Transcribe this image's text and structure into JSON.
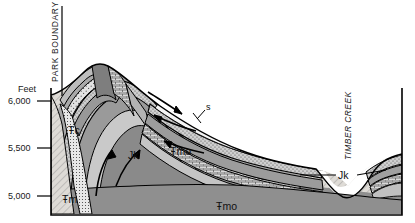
{
  "figure": {
    "type": "geologic-cross-section",
    "background_color": "#ffffff",
    "line_color": "#000000"
  },
  "axis": {
    "unit_label": "Feet",
    "ticks": [
      {
        "label": "6,000",
        "y": 101
      },
      {
        "label": "5,500",
        "y": 148
      },
      {
        "label": "5,000",
        "y": 196
      }
    ]
  },
  "annotations": {
    "park_boundary": "PARK BOUNDARY",
    "timber_creek": "TIMBER CREEK"
  },
  "units": [
    {
      "id": "TRc",
      "label": "Ŧc",
      "x": 77,
      "y": 131,
      "fill": "#a8a8a8"
    },
    {
      "id": "Jk",
      "label": "Jk",
      "x": 134,
      "y": 155,
      "fill": "#d4d4d4"
    },
    {
      "id": "TRmo",
      "label": "Ŧmo",
      "x": 181,
      "y": 152,
      "fill": "#8f8f8f"
    },
    {
      "id": "TRm",
      "label": "Ŧm",
      "x": 70,
      "y": 199,
      "fill": "#d8d6d2"
    },
    {
      "id": "TRmo2",
      "label": "Ŧmo",
      "x": 228,
      "y": 207,
      "fill": "#8f8f8f"
    },
    {
      "id": "Jk2",
      "label": "Jk",
      "x": 344,
      "y": 174,
      "fill": "#d4d4d4"
    },
    {
      "id": "s",
      "label": "s",
      "x": 206,
      "y": 111,
      "fill": "#f2f2f2"
    }
  ],
  "colors": {
    "dark_gray": "#8f8f8f",
    "mid_gray": "#a8a8a8",
    "light_gray": "#c4c4c4",
    "pale_gray": "#dcdcdc",
    "hatch_base": "#dedbd6",
    "stipple_base": "#cfcfcf",
    "white": "#ffffff",
    "outline": "#000000"
  }
}
